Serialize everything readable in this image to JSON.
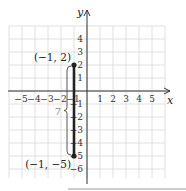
{
  "chart_data": {
    "type": "scatter",
    "title": "",
    "xlabel": "x",
    "ylabel": "y",
    "xlim": [
      -6,
      6
    ],
    "ylim": [
      -7,
      5
    ],
    "grid": true,
    "x_ticks": [
      "-5",
      "-4",
      "-3",
      "-2",
      "-1",
      "1",
      "2",
      "3",
      "4",
      "5"
    ],
    "y_ticks": [
      "4",
      "3",
      "2",
      "1",
      "-1",
      "-2",
      "-3",
      "-4",
      "-5",
      "-6"
    ],
    "points": [
      {
        "x": -1,
        "y": 2,
        "label": "(−1, 2)"
      },
      {
        "x": -1,
        "y": -5,
        "label": "(−1, −5)"
      }
    ],
    "segments": [
      {
        "from": [
          -1,
          2
        ],
        "to": [
          -1,
          -5
        ]
      }
    ],
    "annotations": [
      {
        "text": "7",
        "type": "brace",
        "from": [
          -1,
          2
        ],
        "to": [
          -1,
          -5
        ],
        "meaning": "vertical distance"
      }
    ]
  },
  "colors": {
    "grid": "#d8d8d8",
    "axis": "#333333",
    "segment": "#222222",
    "brace_label": "#888888"
  }
}
